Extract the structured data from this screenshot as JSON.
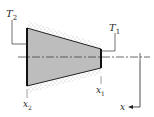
{
  "diagram": {
    "type": "tapered fin / conical section with insulated surface",
    "labels": {
      "T2": {
        "main": "T",
        "sub": "2"
      },
      "T1": {
        "main": "T",
        "sub": "1"
      },
      "x1": {
        "main": "x",
        "sub": "1"
      },
      "x2": {
        "main": "x",
        "sub": "2"
      },
      "axis": "x"
    },
    "colors": {
      "fill": "#b8b8b8",
      "stroke": "#222222",
      "insulation": "#9a9a9a",
      "centerline": "#444444"
    }
  }
}
